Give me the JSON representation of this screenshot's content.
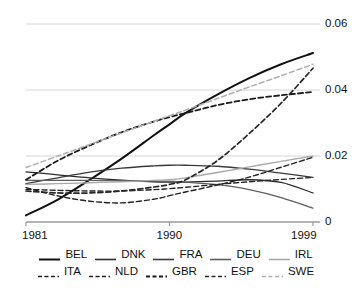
{
  "chart_data": {
    "type": "line",
    "title": "",
    "xlabel": "",
    "ylabel": "",
    "xlim": [
      1981,
      1999
    ],
    "ylim": [
      0,
      0.06
    ],
    "grid": true,
    "gridlines_y": [
      0,
      0.02,
      0.04,
      0.06
    ],
    "y_tick_labels": [
      "0",
      "0.02",
      "0.04",
      "0.06"
    ],
    "x_tick_labels": [
      "1981",
      "1990",
      "1999"
    ],
    "x_ticks": [
      1981,
      1990,
      1999
    ],
    "legend_position": "bottom",
    "x": [
      1981,
      1983,
      1985,
      1987,
      1989,
      1990,
      1991,
      1993,
      1995,
      1997,
      1999
    ],
    "series": [
      {
        "name": "BEL",
        "style": "solid",
        "color": "#111111",
        "width": 2.0,
        "values": [
          0.002,
          0.0068,
          0.0128,
          0.0192,
          0.0262,
          0.0296,
          0.033,
          0.0386,
          0.0436,
          0.0478,
          0.0512
        ]
      },
      {
        "name": "DNK",
        "style": "solid",
        "color": "#2b2b2b",
        "width": 1.3,
        "values": [
          0.0152,
          0.0143,
          0.0134,
          0.0127,
          0.0122,
          0.0121,
          0.0121,
          0.0124,
          0.0128,
          0.012,
          0.0088
        ]
      },
      {
        "name": "FRA",
        "style": "solid",
        "color": "#3a3a3a",
        "width": 1.3,
        "values": [
          0.0116,
          0.0134,
          0.0151,
          0.0163,
          0.017,
          0.0172,
          0.0172,
          0.0169,
          0.016,
          0.0148,
          0.0135
        ]
      },
      {
        "name": "DEU",
        "style": "solid",
        "color": "#5e5e5e",
        "width": 1.3,
        "values": [
          0.0126,
          0.0126,
          0.0126,
          0.0125,
          0.0124,
          0.0123,
          0.0121,
          0.0113,
          0.0098,
          0.0074,
          0.0042
        ]
      },
      {
        "name": "IRL",
        "style": "solid",
        "color": "#a8a8a8",
        "width": 1.3,
        "values": [
          0.0114,
          0.0116,
          0.0119,
          0.0122,
          0.0126,
          0.0128,
          0.0134,
          0.015,
          0.0167,
          0.0184,
          0.02
        ]
      },
      {
        "name": "ITA",
        "style": "dashed",
        "color": "#222222",
        "width": 1.4,
        "values": [
          0.0099,
          0.0096,
          0.0094,
          0.0094,
          0.0098,
          0.0101,
          0.0105,
          0.0114,
          0.0122,
          0.0129,
          0.0135
        ]
      },
      {
        "name": "NLD",
        "style": "dashed",
        "color": "#222222",
        "width": 1.4,
        "values": [
          0.0104,
          0.0079,
          0.0063,
          0.0058,
          0.0069,
          0.008,
          0.0091,
          0.0112,
          0.0136,
          0.0166,
          0.0196
        ]
      },
      {
        "name": "GBR",
        "style": "dashed",
        "color": "#1a1a1a",
        "width": 1.8,
        "values": [
          0.0128,
          0.0186,
          0.0232,
          0.0272,
          0.0304,
          0.0318,
          0.033,
          0.0354,
          0.0372,
          0.0384,
          0.0394
        ]
      },
      {
        "name": "ESP",
        "style": "dashed",
        "color": "#262626",
        "width": 1.7,
        "values": [
          0.0094,
          0.0088,
          0.0088,
          0.0094,
          0.0106,
          0.0114,
          0.0128,
          0.0186,
          0.0268,
          0.036,
          0.0466
        ]
      },
      {
        "name": "SWE",
        "style": "dashed",
        "color": "#b0b0b0",
        "width": 1.5,
        "values": [
          0.0165,
          0.02,
          0.0235,
          0.027,
          0.0305,
          0.0322,
          0.0339,
          0.0374,
          0.0409,
          0.0443,
          0.0478
        ]
      }
    ]
  },
  "axes": {
    "y_labels": [
      {
        "text": "0.06",
        "value": 0.06
      },
      {
        "text": "0.04",
        "value": 0.04
      },
      {
        "text": "0.02",
        "value": 0.02
      },
      {
        "text": "0",
        "value": 0
      }
    ],
    "x_labels": [
      {
        "text": "1981",
        "value": 1981
      },
      {
        "text": "1990",
        "value": 1990
      },
      {
        "text": "1999",
        "value": 1999
      }
    ]
  },
  "legend": {
    "rows": [
      [
        {
          "label": "BEL",
          "style": "solid",
          "color": "#111111",
          "width": 2.0
        },
        {
          "label": "DNK",
          "style": "solid",
          "color": "#2b2b2b",
          "width": 1.6
        },
        {
          "label": "FRA",
          "style": "solid",
          "color": "#3a3a3a",
          "width": 1.6
        },
        {
          "label": "DEU",
          "style": "solid",
          "color": "#5e5e5e",
          "width": 1.6
        },
        {
          "label": "IRL",
          "style": "solid",
          "color": "#a8a8a8",
          "width": 1.6
        }
      ],
      [
        {
          "label": "ITA",
          "style": "dashed",
          "color": "#222222",
          "width": 1.6
        },
        {
          "label": "NLD",
          "style": "dashed",
          "color": "#222222",
          "width": 1.6
        },
        {
          "label": "GBR",
          "style": "dashed",
          "color": "#1a1a1a",
          "width": 1.8
        },
        {
          "label": "ESP",
          "style": "dashed",
          "color": "#262626",
          "width": 1.7
        },
        {
          "label": "SWE",
          "style": "dashed",
          "color": "#b0b0b0",
          "width": 1.6
        }
      ]
    ]
  },
  "style": {
    "grid_color": "#d6d6d6",
    "axis_color": "#9a9a9a",
    "background": "#ffffff",
    "text_color": "#111111"
  }
}
